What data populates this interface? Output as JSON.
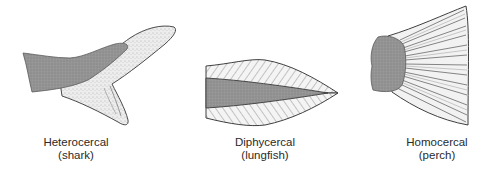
{
  "figures": [
    {
      "name": "Heterocercal",
      "example": "(shark)"
    },
    {
      "name": "Diphycercal",
      "example": "(lungfish)"
    },
    {
      "name": "Homocercal",
      "example": "(perch)"
    }
  ],
  "colors": {
    "body_shade": "#8f8f8f",
    "fin_fill": "#e9e9e9",
    "outline": "#4a4a4a",
    "ray": "#6b6b6b",
    "text": "#2a2a2a"
  }
}
